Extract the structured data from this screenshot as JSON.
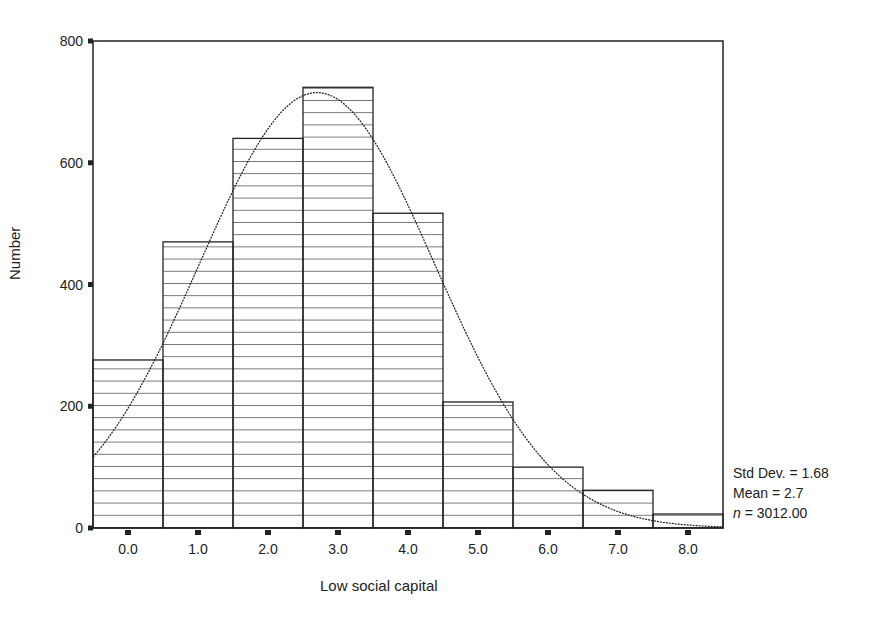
{
  "chart_data": {
    "type": "bar",
    "subtype": "histogram",
    "title": "",
    "xlabel": "Low social capital",
    "ylabel": "Number",
    "categories": [
      "0.0",
      "1.0",
      "2.0",
      "3.0",
      "4.0",
      "5.0",
      "6.0",
      "7.0",
      "8.0"
    ],
    "values": [
      276,
      470,
      640,
      724,
      517,
      207,
      100,
      62,
      23
    ],
    "ylim": [
      0,
      800
    ],
    "yticks": [
      0,
      200,
      400,
      600,
      800
    ],
    "xticks": [
      "0.0",
      "1.0",
      "2.0",
      "3.0",
      "4.0",
      "5.0",
      "6.0",
      "7.0",
      "8.0"
    ],
    "grid": false,
    "bar_fill": "horizontal-hatch",
    "overlay": {
      "type": "normal-curve",
      "mean": 2.7,
      "std_dev": 1.68,
      "n": 3012
    },
    "legend": null,
    "annotations": [
      "Std Dev. = 1.68",
      "Mean = 2.7",
      "n = 3012.00"
    ]
  },
  "stats": {
    "std_dev_label": "Std Dev. = 1.68",
    "mean_label": "Mean = 2.7",
    "n_symbol": "n",
    "n_value": " = 3012.00"
  },
  "axes": {
    "xlabel": "Low social capital",
    "ylabel": "Number"
  },
  "colors": {
    "ink": "#222222",
    "background": "#ffffff"
  }
}
